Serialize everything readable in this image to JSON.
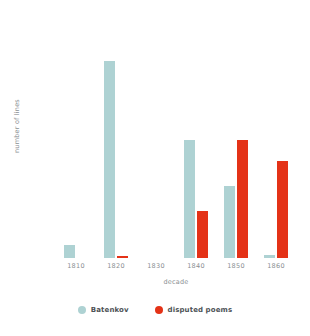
{
  "chart_data": {
    "type": "bar",
    "title": "",
    "xlabel": "decade",
    "ylabel": "number of lines",
    "categories": [
      "1810",
      "1820",
      "1830",
      "1840",
      "1850",
      "1860"
    ],
    "series": [
      {
        "name": "Batenkov",
        "color": "#aed2d3",
        "values": [
          33,
          505,
          0,
          303,
          185,
          8
        ]
      },
      {
        "name": "disputed poems",
        "color": "#e43217",
        "values": [
          0,
          5,
          0,
          120,
          303,
          250
        ]
      }
    ],
    "ylim": [
      0,
      600
    ],
    "yticks": [
      0,
      100,
      200,
      300,
      400,
      500,
      600
    ],
    "ytick_labels": [
      "0",
      "100",
      "200",
      "300",
      "400",
      "500",
      "600"
    ],
    "grid": false,
    "legend_position": "bottom"
  },
  "legend": {
    "items": [
      {
        "label": "Batenkov",
        "color": "#aed2d3",
        "icon": "circle-swatch-icon"
      },
      {
        "label": "disputed poems",
        "color": "#e43217",
        "icon": "circle-swatch-icon"
      }
    ]
  }
}
